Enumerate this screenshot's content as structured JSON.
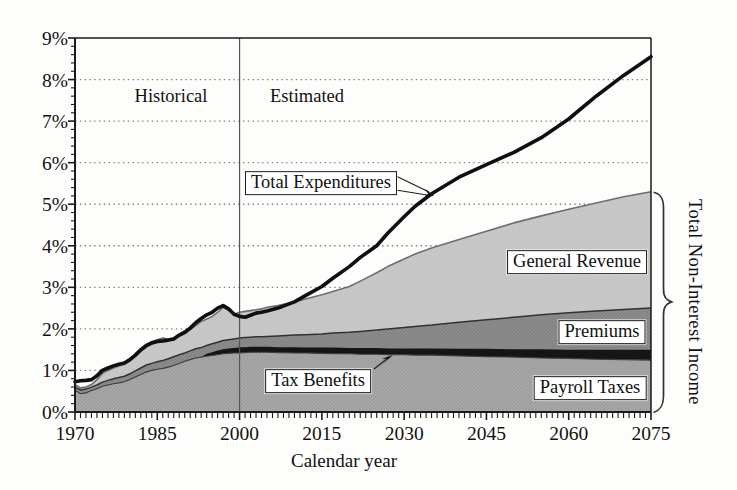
{
  "chart_data": {
    "type": "area",
    "stacked": true,
    "title": "",
    "xlabel": "Calendar year",
    "ylabel": "",
    "xlim": [
      1970,
      2075
    ],
    "ylim": [
      0,
      9
    ],
    "grid": "horizontal-dotted",
    "legend_position": "in-plot boxed labels",
    "x_tick_years": [
      1970,
      1985,
      2000,
      2015,
      2030,
      2045,
      2060,
      2075
    ],
    "x_tick_labels": [
      "1970",
      "1985",
      "2000",
      "2015",
      "2030",
      "2045",
      "2060",
      "2075"
    ],
    "x_minor_tick_step_years": 1,
    "y_tick_values": [
      0,
      1,
      2,
      3,
      4,
      5,
      6,
      7,
      8,
      9
    ],
    "y_tick_labels": [
      "0%",
      "1%",
      "2%",
      "3%",
      "4%",
      "5%",
      "6%",
      "7%",
      "8%",
      "9%"
    ],
    "y_minor_tick_step": 0.2,
    "divider_year": 2000,
    "region_labels": {
      "left": "Historical",
      "right": "Estimated"
    },
    "annotations": {
      "total_expenditures": "Total Expenditures",
      "general_revenue": "General Revenue",
      "premiums": "Premiums",
      "tax_benefits": "Tax Benefits",
      "payroll_taxes": "Payroll Taxes",
      "brace_label": "Total Non-Interest Income"
    },
    "units": "percent of GDP",
    "series_note": "Area series values are cumulative stack tops (percent), read off the chart; Total Expenditures is a line series.",
    "years": [
      1970,
      1971,
      1972,
      1973,
      1974,
      1975,
      1976,
      1977,
      1978,
      1979,
      1980,
      1981,
      1982,
      1983,
      1984,
      1985,
      1986,
      1987,
      1988,
      1989,
      1990,
      1991,
      1992,
      1993,
      1994,
      1995,
      1996,
      1997,
      1998,
      1999,
      2000,
      2001,
      2002,
      2003,
      2004,
      2005,
      2007,
      2010,
      2012,
      2015,
      2017,
      2020,
      2022,
      2025,
      2027,
      2030,
      2032,
      2035,
      2040,
      2045,
      2050,
      2055,
      2060,
      2065,
      2070,
      2075
    ],
    "series": [
      {
        "name": "Payroll Taxes",
        "kind": "area-stack-top",
        "solid": false,
        "color": "#a9a9a9",
        "dot_color": "#8f8f8f",
        "top_stroke": "#3f3f3f",
        "top_stroke_width": 1.1,
        "values": [
          0.52,
          0.44,
          0.46,
          0.52,
          0.56,
          0.62,
          0.65,
          0.68,
          0.7,
          0.73,
          0.78,
          0.84,
          0.9,
          0.96,
          1.0,
          1.03,
          1.05,
          1.08,
          1.12,
          1.17,
          1.22,
          1.26,
          1.3,
          1.32,
          1.34,
          1.36,
          1.38,
          1.4,
          1.41,
          1.42,
          1.42,
          1.43,
          1.44,
          1.44,
          1.44,
          1.44,
          1.43,
          1.42,
          1.42,
          1.41,
          1.4,
          1.4,
          1.39,
          1.39,
          1.38,
          1.38,
          1.37,
          1.37,
          1.35,
          1.33,
          1.32,
          1.3,
          1.29,
          1.27,
          1.26,
          1.25
        ]
      },
      {
        "name": "Tax Benefits",
        "kind": "area-stack-top",
        "solid": true,
        "color": "#151515",
        "dot_color": "#151515",
        "top_stroke": "none",
        "top_stroke_width": 0,
        "values": [
          0.52,
          0.44,
          0.46,
          0.52,
          0.56,
          0.62,
          0.65,
          0.68,
          0.7,
          0.73,
          0.78,
          0.84,
          0.9,
          0.96,
          1.0,
          1.03,
          1.05,
          1.08,
          1.12,
          1.17,
          1.22,
          1.26,
          1.3,
          1.32,
          1.4,
          1.44,
          1.48,
          1.51,
          1.53,
          1.54,
          1.56,
          1.56,
          1.57,
          1.57,
          1.57,
          1.57,
          1.56,
          1.56,
          1.55,
          1.55,
          1.55,
          1.54,
          1.54,
          1.54,
          1.53,
          1.53,
          1.53,
          1.53,
          1.52,
          1.52,
          1.51,
          1.51,
          1.5,
          1.5,
          1.5,
          1.5
        ]
      },
      {
        "name": "Premiums",
        "kind": "area-stack-top",
        "solid": false,
        "color": "#8e8e8e",
        "dot_color": "#747474",
        "top_stroke": "#323232",
        "top_stroke_width": 1.5,
        "values": [
          0.6,
          0.53,
          0.55,
          0.6,
          0.65,
          0.72,
          0.76,
          0.8,
          0.83,
          0.86,
          0.92,
          0.99,
          1.06,
          1.13,
          1.17,
          1.21,
          1.24,
          1.28,
          1.33,
          1.38,
          1.42,
          1.47,
          1.52,
          1.55,
          1.6,
          1.64,
          1.68,
          1.72,
          1.74,
          1.76,
          1.78,
          1.79,
          1.8,
          1.81,
          1.81,
          1.82,
          1.83,
          1.85,
          1.86,
          1.88,
          1.9,
          1.92,
          1.94,
          1.97,
          2.0,
          2.03,
          2.06,
          2.09,
          2.16,
          2.22,
          2.28,
          2.34,
          2.39,
          2.43,
          2.47,
          2.5
        ]
      },
      {
        "name": "General Revenue",
        "kind": "area-stack-top",
        "solid": false,
        "top_is": "Total Non-Interest Income",
        "color": "#cbcbcb",
        "dot_color": "#b9b9b9",
        "top_stroke": "#6e6e6e",
        "top_stroke_width": 1.6,
        "values": [
          0.66,
          0.58,
          0.6,
          0.66,
          0.78,
          0.93,
          1.0,
          1.06,
          1.11,
          1.15,
          1.23,
          1.34,
          1.46,
          1.56,
          1.7,
          1.74,
          1.78,
          1.75,
          1.78,
          1.83,
          1.88,
          1.98,
          2.08,
          2.18,
          2.24,
          2.3,
          2.4,
          2.52,
          2.45,
          2.35,
          2.4,
          2.42,
          2.44,
          2.46,
          2.48,
          2.52,
          2.56,
          2.65,
          2.72,
          2.82,
          2.9,
          3.02,
          3.15,
          3.35,
          3.5,
          3.68,
          3.8,
          3.95,
          4.15,
          4.35,
          4.55,
          4.72,
          4.88,
          5.03,
          5.18,
          5.3
        ]
      },
      {
        "name": "Total Expenditures",
        "kind": "line",
        "color": "#0f0f0f",
        "width": 3.6,
        "values": [
          0.73,
          0.75,
          0.76,
          0.78,
          0.87,
          1.0,
          1.06,
          1.11,
          1.15,
          1.18,
          1.26,
          1.37,
          1.5,
          1.6,
          1.66,
          1.7,
          1.71,
          1.73,
          1.76,
          1.85,
          1.92,
          2.02,
          2.15,
          2.25,
          2.34,
          2.4,
          2.5,
          2.56,
          2.48,
          2.35,
          2.3,
          2.28,
          2.33,
          2.38,
          2.4,
          2.43,
          2.5,
          2.65,
          2.8,
          3.02,
          3.22,
          3.5,
          3.72,
          4.0,
          4.3,
          4.7,
          4.95,
          5.25,
          5.65,
          5.95,
          6.25,
          6.6,
          7.05,
          7.6,
          8.1,
          8.55
        ]
      }
    ],
    "colors": {
      "gridline": "#808080",
      "axis": "#1a1a1a",
      "divider": "#555555",
      "brace": "#333333"
    }
  }
}
